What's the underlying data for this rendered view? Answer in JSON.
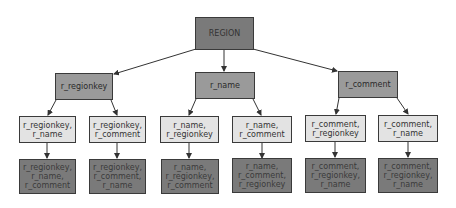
{
  "colors": {
    "root_fill": "#7a7a7a",
    "level2_fill": "#9a9a9a",
    "level3_fill": "#e3e3e3",
    "level4_fill": "#7a7a7a",
    "edge": "#333333"
  },
  "tree": {
    "root": "REGION",
    "level2": [
      "r_regionkey",
      "r_name",
      "r_comment"
    ],
    "level3": [
      "r_regionkey,\nr_name",
      "r_regionkey,\nr_comment",
      "r_name,\nr_regionkey",
      "r_name,\nr_comment",
      "r_comment,\nr_regionkey",
      "r_comment,\nr_name"
    ],
    "level4": [
      "r_regionkey,\nr_name,\nr_comment",
      "r_regionkey,\nr_comment,\nr_name",
      "r_name,\nr_regionkey,\nr_comment",
      "r_name,\nr_comment,\nr_regionkey",
      "r_comment,\nr_regionkey,\nr_name",
      "r_comment,\nr_regionkey,\nr_name"
    ]
  }
}
